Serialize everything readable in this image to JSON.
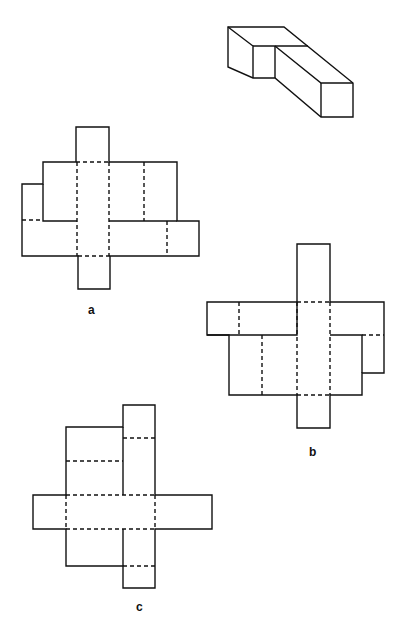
{
  "figure": {
    "solid_shape": {
      "name": "3D L-shaped block",
      "position": "top-right"
    },
    "nets": [
      {
        "id": "a",
        "label": "a"
      },
      {
        "id": "b",
        "label": "b"
      },
      {
        "id": "c",
        "label": "c"
      }
    ]
  },
  "colors": {
    "line": "#111111",
    "background": "#ffffff"
  }
}
